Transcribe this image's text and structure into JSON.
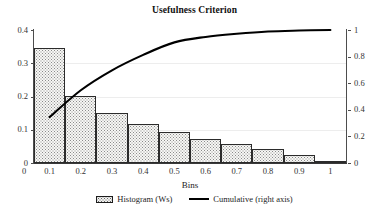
{
  "chart_data": {
    "type": "bar",
    "title": "Usefulness Criterion",
    "xlabel": "Bins",
    "ylabel": "",
    "grid": true,
    "legend_position": "bottom",
    "categories": [
      "0.1",
      "0.2",
      "0.3",
      "0.4",
      "0.5",
      "0.6",
      "0.7",
      "0.8",
      "0.9",
      "1"
    ],
    "x_tick_labels": [
      "0.1",
      "0.2",
      "0.3",
      "0.4",
      "0.5",
      "0.6",
      "0.7",
      "0.8",
      "0.9",
      "1"
    ],
    "y_left_tick_labels": [
      "0",
      "0.1",
      "0.2",
      "0.3",
      "0.4"
    ],
    "y_right_tick_labels": [
      "0",
      "0.2",
      "0.4",
      "0.6",
      "0.8",
      "1"
    ],
    "ylim_left": [
      0,
      0.4
    ],
    "ylim_right": [
      0,
      1
    ],
    "series": [
      {
        "name": "Histogram (Ws)",
        "type": "bar",
        "axis": "left",
        "values": [
          0.345,
          0.202,
          0.15,
          0.116,
          0.094,
          0.073,
          0.056,
          0.043,
          0.023,
          0.005
        ]
      },
      {
        "name": "Cumulative (right axis)",
        "type": "line",
        "axis": "right",
        "values": [
          0.345,
          0.547,
          0.697,
          0.813,
          0.907,
          0.948,
          0.972,
          0.989,
          0.996,
          1.0
        ]
      }
    ],
    "legend": [
      {
        "label": "Histogram (Ws)",
        "marker": "histogram-swatch"
      },
      {
        "label": "Cumulative (right axis)",
        "marker": "line-swatch"
      }
    ],
    "colors": {
      "bar_fill": "#f7f7f5",
      "bar_border": "#2b2b2b",
      "line": "#000000",
      "grid": "#ededed",
      "axis": "#4d4d4d",
      "text": "#1c1c1c"
    }
  }
}
